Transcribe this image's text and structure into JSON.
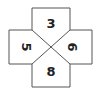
{
  "diagram": {
    "shape": "cross divided by diagonals into four regions",
    "regions": {
      "top": {
        "label": "3",
        "rotation": "upright"
      },
      "left": {
        "label": "5",
        "rotation": "rotated 90 degrees clockwise"
      },
      "right": {
        "label": "6",
        "rotation": "rotated 90 degrees clockwise"
      },
      "bottom": {
        "label": "8",
        "rotation": "upright"
      }
    },
    "stroke_color": "#555555",
    "fill_color": "#ffffff"
  }
}
